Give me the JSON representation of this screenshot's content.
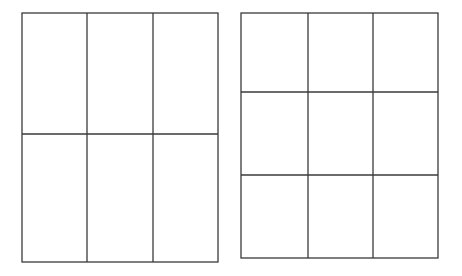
{
  "diagram": {
    "stroke_color": "#3a3a3a",
    "background": "#ffffff",
    "grids": [
      {
        "name": "grid-3x2",
        "columns": 3,
        "rows": 2,
        "x": 22,
        "y": 13,
        "width": 196,
        "height": 249,
        "col_lines": [
          87,
          153
        ],
        "row_lines": [
          134
        ]
      },
      {
        "name": "grid-3x3",
        "columns": 3,
        "rows": 3,
        "x": 241,
        "y": 13,
        "width": 197,
        "height": 245,
        "col_lines": [
          308,
          373
        ],
        "row_lines": [
          92,
          175
        ]
      }
    ]
  }
}
